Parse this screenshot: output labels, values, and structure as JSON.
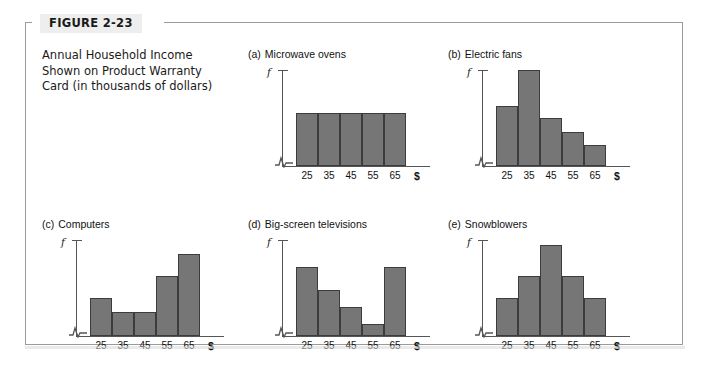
{
  "figure": {
    "label": "FIGURE 2-23",
    "caption_lines": [
      "Annual Household Income",
      "Shown on Product Warranty",
      "Card (in thousands of dollars)"
    ],
    "bar_color": "#767676",
    "bar_border_color": "#3c3c3c",
    "frame_color": "#9a9a9a"
  },
  "axis": {
    "y_label": "f",
    "x_unit": "$",
    "x_tick_labels": [
      "25",
      "35",
      "45",
      "55",
      "65"
    ],
    "break_symbol": "axis-break-zigzag"
  },
  "chart_data": [
    {
      "type": "bar",
      "panel": "a",
      "marker": "(a)",
      "title": "Microwave ovens",
      "shape": "uniform",
      "categories": [
        "25",
        "35",
        "45",
        "55",
        "65"
      ],
      "values": [
        55,
        55,
        55,
        55,
        55
      ],
      "xlabel": "$",
      "ylabel": "f",
      "ylim": [
        0,
        100
      ],
      "grid": false,
      "legend": "none"
    },
    {
      "type": "bar",
      "panel": "b",
      "marker": "(b)",
      "title": "Electric fans",
      "shape": "skewed-right",
      "categories": [
        "25",
        "35",
        "45",
        "55",
        "65"
      ],
      "values": [
        62,
        100,
        50,
        35,
        22
      ],
      "xlabel": "$",
      "ylabel": "f",
      "ylim": [
        0,
        100
      ],
      "grid": false,
      "legend": "none"
    },
    {
      "type": "bar",
      "panel": "c",
      "marker": "(c)",
      "title": "Computers",
      "shape": "skewed-left",
      "categories": [
        "25",
        "35",
        "45",
        "55",
        "65"
      ],
      "values": [
        40,
        25,
        25,
        62,
        85
      ],
      "xlabel": "$",
      "ylabel": "f",
      "ylim": [
        0,
        100
      ],
      "grid": false,
      "legend": "none"
    },
    {
      "type": "bar",
      "panel": "d",
      "marker": "(d)",
      "title": "Big-screen televisions",
      "shape": "j-shaped",
      "categories": [
        "25",
        "35",
        "45",
        "55",
        "65"
      ],
      "values": [
        72,
        48,
        30,
        12,
        72
      ],
      "xlabel": "$",
      "ylabel": "f",
      "ylim": [
        0,
        100
      ],
      "grid": false,
      "legend": "none"
    },
    {
      "type": "bar",
      "panel": "e",
      "marker": "(e)",
      "title": "Snowblowers",
      "shape": "symmetric",
      "categories": [
        "25",
        "35",
        "45",
        "55",
        "65"
      ],
      "values": [
        40,
        62,
        95,
        62,
        40
      ],
      "xlabel": "$",
      "ylabel": "f",
      "ylim": [
        0,
        100
      ],
      "grid": false,
      "legend": "none"
    }
  ]
}
